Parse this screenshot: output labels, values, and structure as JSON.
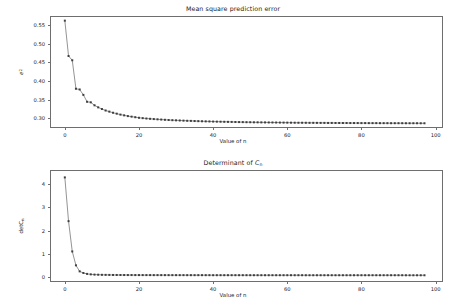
{
  "figure": {
    "width": 466,
    "height": 308,
    "background": "#ffffff",
    "line_color": "#4c4c4c",
    "marker_color": "#3f3f3f",
    "axis_color": "#6e6e6e",
    "text_color": "#1a1a1a"
  },
  "chart_data": [
    {
      "type": "line",
      "id": "mean-square-prediction-error",
      "title": "Mean square prediction error",
      "xlabel": "Value of n",
      "ylabel": "e²",
      "ylabel_parts": {
        "base": "e",
        "sup": "2"
      },
      "xlim": [
        -4,
        102
      ],
      "ylim": [
        0.2735,
        0.5745
      ],
      "xticks": [
        0,
        20,
        40,
        60,
        80,
        100
      ],
      "yticks": [
        0.3,
        0.35,
        0.4,
        0.45,
        0.5,
        0.55
      ],
      "ytick_labels": [
        "0.30",
        "0.35",
        "0.40",
        "0.45",
        "0.50",
        "0.55"
      ],
      "xtick_labels": [
        "0",
        "20",
        "40",
        "60",
        "80",
        "100"
      ],
      "grid": false,
      "legend": null,
      "marker": "square",
      "x": [
        0,
        1,
        2,
        3,
        4,
        5,
        6,
        7,
        8,
        9,
        10,
        11,
        12,
        13,
        14,
        15,
        16,
        17,
        18,
        19,
        20,
        21,
        22,
        23,
        24,
        25,
        26,
        27,
        28,
        29,
        30,
        31,
        32,
        33,
        34,
        35,
        36,
        37,
        38,
        39,
        40,
        41,
        42,
        43,
        44,
        45,
        46,
        47,
        48,
        49,
        50,
        51,
        52,
        53,
        54,
        55,
        56,
        57,
        58,
        59,
        60,
        61,
        62,
        63,
        64,
        65,
        66,
        67,
        68,
        69,
        70,
        71,
        72,
        73,
        74,
        75,
        76,
        77,
        78,
        79,
        80,
        81,
        82,
        83,
        84,
        85,
        86,
        87,
        88,
        89,
        90,
        91,
        92,
        93,
        94,
        95,
        96,
        97
      ],
      "values": [
        0.562,
        0.467,
        0.4555,
        0.379,
        0.377,
        0.3625,
        0.344,
        0.3425,
        0.3345,
        0.329,
        0.3245,
        0.3205,
        0.3175,
        0.3145,
        0.312,
        0.3095,
        0.3075,
        0.3055,
        0.304,
        0.3025,
        0.301,
        0.3,
        0.299,
        0.2982,
        0.2975,
        0.2968,
        0.2962,
        0.2956,
        0.295,
        0.2945,
        0.2941,
        0.2937,
        0.2933,
        0.2929,
        0.2926,
        0.2922,
        0.2919,
        0.2916,
        0.2913,
        0.2911,
        0.2908,
        0.2906,
        0.2904,
        0.2902,
        0.29,
        0.2898,
        0.2896,
        0.2894,
        0.2893,
        0.2891,
        0.289,
        0.2888,
        0.2887,
        0.2886,
        0.2885,
        0.2884,
        0.2883,
        0.2882,
        0.2881,
        0.288,
        0.2879,
        0.2878,
        0.2877,
        0.2876,
        0.2876,
        0.2875,
        0.2874,
        0.2874,
        0.2873,
        0.2872,
        0.2872,
        0.2871,
        0.2871,
        0.287,
        0.287,
        0.2869,
        0.2869,
        0.2868,
        0.2868,
        0.2868,
        0.2867,
        0.2867,
        0.2866,
        0.2866,
        0.2866,
        0.2865,
        0.2865,
        0.2865,
        0.2864,
        0.2864,
        0.2864,
        0.2864,
        0.2863,
        0.2863,
        0.2863,
        0.2863,
        0.2862,
        0.2862
      ]
    },
    {
      "type": "line",
      "id": "determinant-of-cn",
      "title": "Determinant of Cₙ",
      "title_parts": {
        "prefix": "Determinant of ",
        "symbol": "C",
        "sub": "n"
      },
      "xlabel": "Value of n",
      "ylabel": "detCₙ",
      "ylabel_parts": {
        "base": "detC",
        "sub": "n"
      },
      "xlim": [
        -4,
        102
      ],
      "ylim": [
        -0.22,
        4.62
      ],
      "xticks": [
        0,
        20,
        40,
        60,
        80,
        100
      ],
      "yticks": [
        0,
        1,
        2,
        3,
        4
      ],
      "ytick_labels": [
        "0",
        "1",
        "2",
        "3",
        "4"
      ],
      "xtick_labels": [
        "0",
        "20",
        "40",
        "60",
        "80",
        "100"
      ],
      "grid": false,
      "legend": null,
      "marker": "square",
      "x": [
        0,
        1,
        2,
        3,
        4,
        5,
        6,
        7,
        8,
        9,
        10,
        11,
        12,
        13,
        14,
        15,
        16,
        17,
        18,
        19,
        20,
        21,
        22,
        23,
        24,
        25,
        26,
        27,
        28,
        29,
        30,
        31,
        32,
        33,
        34,
        35,
        36,
        37,
        38,
        39,
        40,
        41,
        42,
        43,
        44,
        45,
        46,
        47,
        48,
        49,
        50,
        51,
        52,
        53,
        54,
        55,
        56,
        57,
        58,
        59,
        60,
        61,
        62,
        63,
        64,
        65,
        66,
        67,
        68,
        69,
        70,
        71,
        72,
        73,
        74,
        75,
        76,
        77,
        78,
        79,
        80,
        81,
        82,
        83,
        84,
        85,
        86,
        87,
        88,
        89,
        90,
        91,
        92,
        93,
        94,
        95,
        96,
        97
      ],
      "values": [
        4.3,
        2.41,
        1.1,
        0.5,
        0.24,
        0.17,
        0.13,
        0.11,
        0.1,
        0.095,
        0.09,
        0.088,
        0.086,
        0.084,
        0.083,
        0.082,
        0.081,
        0.08,
        0.08,
        0.079,
        0.079,
        0.078,
        0.078,
        0.078,
        0.077,
        0.077,
        0.077,
        0.077,
        0.076,
        0.076,
        0.076,
        0.076,
        0.076,
        0.075,
        0.075,
        0.075,
        0.075,
        0.075,
        0.075,
        0.075,
        0.074,
        0.074,
        0.074,
        0.074,
        0.074,
        0.074,
        0.074,
        0.074,
        0.074,
        0.074,
        0.073,
        0.073,
        0.073,
        0.073,
        0.073,
        0.073,
        0.073,
        0.073,
        0.073,
        0.073,
        0.073,
        0.073,
        0.073,
        0.073,
        0.073,
        0.072,
        0.072,
        0.072,
        0.072,
        0.072,
        0.072,
        0.072,
        0.072,
        0.072,
        0.072,
        0.072,
        0.072,
        0.072,
        0.072,
        0.072,
        0.072,
        0.072,
        0.072,
        0.072,
        0.072,
        0.072,
        0.072,
        0.072,
        0.072,
        0.072,
        0.072,
        0.072,
        0.071,
        0.071,
        0.071,
        0.071,
        0.071,
        0.071
      ]
    }
  ]
}
